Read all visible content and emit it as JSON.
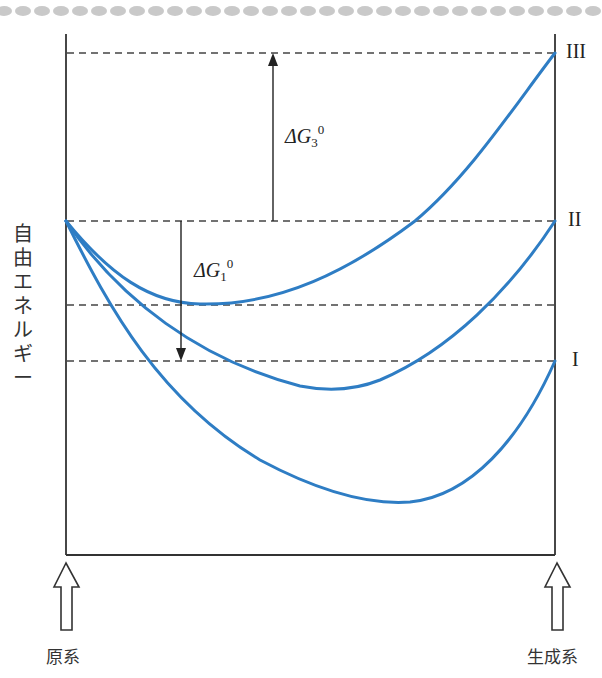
{
  "diagram": {
    "y_axis_label": "自由エネルギー",
    "y_axis_chars": [
      "自",
      "由",
      "エ",
      "ネ",
      "ル",
      "ギ",
      "ー"
    ],
    "levels": [
      {
        "id": "III",
        "label": "III",
        "y": 53
      },
      {
        "id": "II",
        "label": "II",
        "y": 221
      },
      {
        "id": "mid",
        "label": "",
        "y": 305
      },
      {
        "id": "I",
        "label": "I",
        "y": 361
      }
    ],
    "energy_changes": [
      {
        "id": "dG3",
        "symbol": "ΔG",
        "subscript": "3",
        "superscript": "0",
        "direction": "up",
        "from_level": "II",
        "to_level": "III"
      },
      {
        "id": "dG1",
        "symbol": "ΔG",
        "subscript": "1",
        "superscript": "0",
        "direction": "down",
        "from_level": "II",
        "to_level": "I"
      }
    ],
    "curves": [
      {
        "id": "curve-III",
        "end_level": "III",
        "min_x": 200,
        "min_y": 304
      },
      {
        "id": "curve-II",
        "end_level": "II",
        "min_x": 330,
        "min_y": 390
      },
      {
        "id": "curve-I",
        "end_level": "I",
        "min_x": 410,
        "min_y": 502
      }
    ],
    "start_label": "原系",
    "end_label": "生成系",
    "colors": {
      "curve": "#2e7dc4",
      "axis": "#333333",
      "dash": "#444444",
      "dots": "#c8c8c8"
    }
  }
}
